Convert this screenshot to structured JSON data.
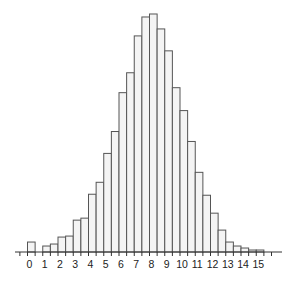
{
  "chart_data": {
    "type": "bar",
    "title": "",
    "xlabel": "",
    "ylabel": "",
    "grid": false,
    "legend": null,
    "bin_width": 0.5,
    "bin_starts": [
      0,
      0.5,
      1,
      1.5,
      2,
      2.5,
      3,
      3.5,
      4,
      4.5,
      5,
      5.5,
      6,
      6.5,
      7,
      7.5,
      8,
      8.5,
      9,
      9.5,
      10,
      10.5,
      11,
      11.5,
      12,
      12.5,
      13,
      13.5,
      14,
      14.5,
      15,
      15.5
    ],
    "values": [
      10,
      0,
      6,
      8,
      15,
      16,
      32,
      34,
      58,
      70,
      99,
      121,
      160,
      180,
      217,
      236,
      239,
      224,
      202,
      165,
      142,
      111,
      80,
      57,
      39,
      22,
      10,
      6,
      4,
      2,
      2,
      0
    ],
    "x_tick_labels": [
      "0",
      "1",
      "2",
      "3",
      "4",
      "5",
      "6",
      "7",
      "8",
      "9",
      "10",
      "11",
      "12",
      "13",
      "14",
      "15"
    ],
    "xlim": [
      -0.8,
      16.8
    ],
    "ylim": [
      0,
      240
    ],
    "bar_fill": "#f4f4f4",
    "bar_edge": "#555555",
    "axis_color": "#333333"
  }
}
